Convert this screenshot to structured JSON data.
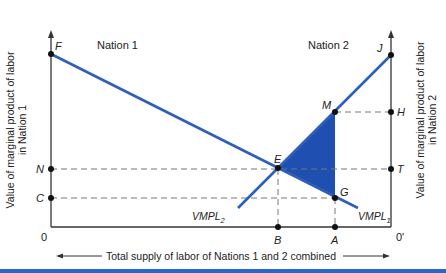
{
  "diagram": {
    "region_labels": {
      "nation1": "Nation 1",
      "nation2": "Nation 2"
    },
    "y_axis_left": {
      "line1": "Value of marginal product of labor",
      "line2": "in Nation 1"
    },
    "y_axis_right": {
      "line1": "Value of marginal product of labor",
      "line2": "in Nation 2"
    },
    "x_axis": {
      "label": "Total supply of labor of Nations 1 and 2 combined",
      "origin_left": "0",
      "origin_right": "0'"
    },
    "points": {
      "F": "F",
      "J": "J",
      "M": "M",
      "H": "H",
      "E": "E",
      "N": "N",
      "T": "T",
      "C": "C",
      "G": "G",
      "B": "B",
      "A": "A"
    },
    "curves": {
      "vmpl1": {
        "base": "VMPL",
        "sub": "1"
      },
      "vmpl2": {
        "base": "VMPL",
        "sub": "2"
      }
    },
    "colors": {
      "curve": "#2f5fb8",
      "shade": "#1f4fb0",
      "axis": "#333333",
      "bar": "#2a66c4"
    }
  }
}
